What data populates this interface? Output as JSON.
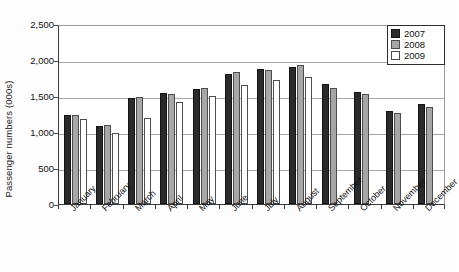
{
  "chart_data": {
    "type": "bar",
    "title": "",
    "subtitle": "",
    "xlabel": "",
    "ylabel": "Passenger numbers (000s)",
    "ylim": [
      0,
      2500
    ],
    "ytick_values": [
      0,
      500,
      1000,
      1500,
      2000,
      2500
    ],
    "ytick_labels": [
      "0",
      "500",
      "1,000",
      "1,500",
      "2,000",
      "2,500"
    ],
    "grid": true,
    "legend_position": "top-right",
    "categories": [
      "January",
      "February",
      "March",
      "April",
      "May",
      "June",
      "July",
      "August",
      "September",
      "October",
      "November",
      "December"
    ],
    "series": [
      {
        "name": "2007",
        "color": "#2b2b2b",
        "values": [
          1240,
          1085,
          1470,
          1545,
          1600,
          1805,
          1875,
          1900,
          1665,
          1555,
          1290,
          1390
        ]
      },
      {
        "name": "2008",
        "color": "#a6a6a6",
        "values": [
          1230,
          1100,
          1485,
          1530,
          1610,
          1835,
          1860,
          1930,
          1610,
          1525,
          1265,
          1345
        ]
      },
      {
        "name": "2009",
        "color": "#ffffff",
        "values": [
          1180,
          985,
          1195,
          1415,
          1500,
          1655,
          1720,
          1765,
          null,
          null,
          null,
          null
        ]
      }
    ]
  },
  "legend": {
    "entries": [
      {
        "label": "2007",
        "swatch": "s2007"
      },
      {
        "label": "2008",
        "swatch": "s2008"
      },
      {
        "label": "2009",
        "swatch": "s2009"
      }
    ]
  }
}
